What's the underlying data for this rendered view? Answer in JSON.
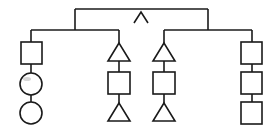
{
  "diagram": {
    "type": "tree",
    "stroke_color": "#1a1a1a",
    "background": "#ffffff",
    "root": {
      "symbol": "caret",
      "glyph": "^",
      "children": [
        "left_group",
        "right_group"
      ]
    },
    "left_group": {
      "branches": [
        {
          "column": 1,
          "shapes": [
            "square",
            "circle",
            "circle"
          ]
        },
        {
          "column": 2,
          "shapes": [
            "triangle",
            "square",
            "triangle"
          ]
        }
      ]
    },
    "right_group": {
      "branches": [
        {
          "column": 3,
          "shapes": [
            "triangle",
            "square",
            "triangle"
          ]
        },
        {
          "column": 4,
          "shapes": [
            "square",
            "square",
            "square"
          ]
        }
      ]
    }
  }
}
